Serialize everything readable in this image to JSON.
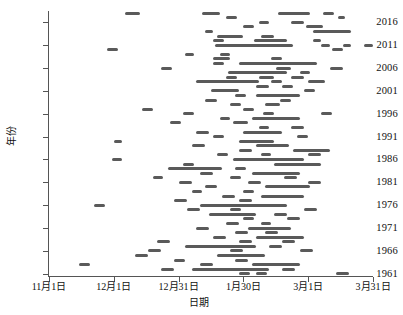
{
  "chart_data": {
    "type": "scatter",
    "title": "",
    "xlabel": "日期",
    "ylabel": "年份",
    "grid": false,
    "legend": null,
    "x_axis": {
      "unit": "day-of-season (day 0 = 11月1日)",
      "min": 0,
      "max": 150,
      "tick_values": [
        0,
        30,
        60,
        90,
        120,
        150
      ],
      "tick_labels": [
        "11月1日",
        "12月1日",
        "12月31日",
        "1月30日",
        "3月1日",
        "3月31日"
      ]
    },
    "y_axis": {
      "min": 1960.5,
      "max": 2018.5,
      "tick_values": [
        1961,
        1966,
        1971,
        1976,
        1981,
        1986,
        1991,
        1996,
        2001,
        2006,
        2011,
        2016
      ],
      "tick_labels": [
        "1961",
        "1966",
        "1971",
        "1976",
        "1981",
        "1986",
        "1991",
        "1996",
        "2001",
        "2006",
        "2011",
        "2016"
      ]
    },
    "marker": {
      "shape": "horizontal-bar",
      "color": "#5a5a5a",
      "height_px": 3,
      "description": "each bar is a continuous run of daily points = one snow-cover / event interval"
    },
    "series_name": "逐年事件日期区间",
    "segments": [
      {
        "year": 2018,
        "start": 35,
        "end": 42
      },
      {
        "year": 2018,
        "start": 71,
        "end": 79
      },
      {
        "year": 2018,
        "start": 106,
        "end": 121
      },
      {
        "year": 2018,
        "start": 127,
        "end": 132
      },
      {
        "year": 2017,
        "start": 82,
        "end": 87
      },
      {
        "year": 2017,
        "start": 134,
        "end": 137
      },
      {
        "year": 2016,
        "start": 97,
        "end": 102
      },
      {
        "year": 2016,
        "start": 112,
        "end": 118
      },
      {
        "year": 2015,
        "start": 90,
        "end": 95
      },
      {
        "year": 2015,
        "start": 119,
        "end": 127
      },
      {
        "year": 2014,
        "start": 72,
        "end": 76
      },
      {
        "year": 2014,
        "start": 122,
        "end": 140
      },
      {
        "year": 2013,
        "start": 78,
        "end": 90
      },
      {
        "year": 2013,
        "start": 98,
        "end": 104
      },
      {
        "year": 2012,
        "start": 76,
        "end": 81
      },
      {
        "year": 2012,
        "start": 95,
        "end": 110
      },
      {
        "year": 2012,
        "start": 122,
        "end": 126
      },
      {
        "year": 2011,
        "start": 77,
        "end": 113
      },
      {
        "year": 2011,
        "start": 126,
        "end": 130
      },
      {
        "year": 2011,
        "start": 136,
        "end": 140
      },
      {
        "year": 2011,
        "start": 146,
        "end": 150
      },
      {
        "year": 2010,
        "start": 27,
        "end": 32
      },
      {
        "year": 2010,
        "start": 131,
        "end": 136
      },
      {
        "year": 2009,
        "start": 63,
        "end": 67
      },
      {
        "year": 2009,
        "start": 79,
        "end": 84
      },
      {
        "year": 2008,
        "start": 103,
        "end": 108
      },
      {
        "year": 2008,
        "start": 76,
        "end": 84
      },
      {
        "year": 2007,
        "start": 88,
        "end": 124
      },
      {
        "year": 2007,
        "start": 76,
        "end": 81
      },
      {
        "year": 2006,
        "start": 52,
        "end": 57
      },
      {
        "year": 2006,
        "start": 105,
        "end": 112
      },
      {
        "year": 2006,
        "start": 130,
        "end": 136
      },
      {
        "year": 2005,
        "start": 83,
        "end": 110
      },
      {
        "year": 2005,
        "start": 116,
        "end": 121
      },
      {
        "year": 2004,
        "start": 82,
        "end": 87
      },
      {
        "year": 2004,
        "start": 97,
        "end": 104
      },
      {
        "year": 2004,
        "start": 112,
        "end": 118
      },
      {
        "year": 2003,
        "start": 68,
        "end": 97
      },
      {
        "year": 2003,
        "start": 103,
        "end": 108
      },
      {
        "year": 2003,
        "start": 120,
        "end": 128
      },
      {
        "year": 2002,
        "start": 96,
        "end": 102
      },
      {
        "year": 2002,
        "start": 108,
        "end": 113
      },
      {
        "year": 2001,
        "start": 75,
        "end": 88
      },
      {
        "year": 2001,
        "start": 118,
        "end": 123
      },
      {
        "year": 2000,
        "start": 86,
        "end": 91
      },
      {
        "year": 2000,
        "start": 96,
        "end": 116
      },
      {
        "year": 1999,
        "start": 72,
        "end": 78
      },
      {
        "year": 1999,
        "start": 107,
        "end": 112
      },
      {
        "year": 1998,
        "start": 84,
        "end": 89
      },
      {
        "year": 1998,
        "start": 100,
        "end": 107
      },
      {
        "year": 1997,
        "start": 43,
        "end": 48
      },
      {
        "year": 1997,
        "start": 90,
        "end": 95
      },
      {
        "year": 1996,
        "start": 62,
        "end": 67
      },
      {
        "year": 1996,
        "start": 99,
        "end": 104
      },
      {
        "year": 1996,
        "start": 126,
        "end": 131
      },
      {
        "year": 1995,
        "start": 79,
        "end": 84
      },
      {
        "year": 1995,
        "start": 94,
        "end": 116
      },
      {
        "year": 1994,
        "start": 56,
        "end": 61
      },
      {
        "year": 1994,
        "start": 85,
        "end": 92
      },
      {
        "year": 1993,
        "start": 97,
        "end": 102
      },
      {
        "year": 1993,
        "start": 112,
        "end": 118
      },
      {
        "year": 1992,
        "start": 68,
        "end": 74
      },
      {
        "year": 1992,
        "start": 90,
        "end": 108
      },
      {
        "year": 1991,
        "start": 76,
        "end": 81
      },
      {
        "year": 1991,
        "start": 115,
        "end": 120
      },
      {
        "year": 1990,
        "start": 30,
        "end": 34
      },
      {
        "year": 1990,
        "start": 88,
        "end": 104
      },
      {
        "year": 1989,
        "start": 66,
        "end": 72
      },
      {
        "year": 1989,
        "start": 96,
        "end": 111
      },
      {
        "year": 1988,
        "start": 88,
        "end": 94
      },
      {
        "year": 1988,
        "start": 113,
        "end": 130
      },
      {
        "year": 1987,
        "start": 78,
        "end": 83
      },
      {
        "year": 1987,
        "start": 98,
        "end": 103
      },
      {
        "year": 1987,
        "start": 120,
        "end": 126
      },
      {
        "year": 1986,
        "start": 29,
        "end": 34
      },
      {
        "year": 1986,
        "start": 85,
        "end": 118
      },
      {
        "year": 1985,
        "start": 62,
        "end": 67
      },
      {
        "year": 1985,
        "start": 104,
        "end": 126
      },
      {
        "year": 1984,
        "start": 55,
        "end": 80
      },
      {
        "year": 1984,
        "start": 86,
        "end": 91
      },
      {
        "year": 1983,
        "start": 70,
        "end": 76
      },
      {
        "year": 1983,
        "start": 94,
        "end": 116
      },
      {
        "year": 1982,
        "start": 48,
        "end": 53
      },
      {
        "year": 1982,
        "start": 84,
        "end": 89
      },
      {
        "year": 1982,
        "start": 109,
        "end": 115
      },
      {
        "year": 1981,
        "start": 60,
        "end": 66
      },
      {
        "year": 1981,
        "start": 92,
        "end": 98
      },
      {
        "year": 1981,
        "start": 120,
        "end": 126
      },
      {
        "year": 1980,
        "start": 72,
        "end": 78
      },
      {
        "year": 1980,
        "start": 100,
        "end": 121
      },
      {
        "year": 1979,
        "start": 66,
        "end": 71
      },
      {
        "year": 1979,
        "start": 90,
        "end": 95
      },
      {
        "year": 1978,
        "start": 80,
        "end": 86
      },
      {
        "year": 1978,
        "start": 98,
        "end": 118
      },
      {
        "year": 1977,
        "start": 58,
        "end": 64
      },
      {
        "year": 1977,
        "start": 88,
        "end": 94
      },
      {
        "year": 1976,
        "start": 21,
        "end": 26
      },
      {
        "year": 1976,
        "start": 70,
        "end": 110
      },
      {
        "year": 1975,
        "start": 64,
        "end": 70
      },
      {
        "year": 1975,
        "start": 84,
        "end": 89
      },
      {
        "year": 1975,
        "start": 118,
        "end": 124
      },
      {
        "year": 1974,
        "start": 74,
        "end": 96
      },
      {
        "year": 1974,
        "start": 104,
        "end": 110
      },
      {
        "year": 1973,
        "start": 90,
        "end": 95
      },
      {
        "year": 1973,
        "start": 110,
        "end": 116
      },
      {
        "year": 1972,
        "start": 82,
        "end": 88
      },
      {
        "year": 1972,
        "start": 98,
        "end": 103
      },
      {
        "year": 1971,
        "start": 68,
        "end": 74
      },
      {
        "year": 1971,
        "start": 92,
        "end": 112
      },
      {
        "year": 1970,
        "start": 86,
        "end": 92
      },
      {
        "year": 1970,
        "start": 100,
        "end": 106
      },
      {
        "year": 1969,
        "start": 76,
        "end": 82
      },
      {
        "year": 1969,
        "start": 96,
        "end": 118
      },
      {
        "year": 1968,
        "start": 50,
        "end": 56
      },
      {
        "year": 1968,
        "start": 88,
        "end": 94
      },
      {
        "year": 1968,
        "start": 108,
        "end": 114
      },
      {
        "year": 1967,
        "start": 63,
        "end": 96
      },
      {
        "year": 1967,
        "start": 102,
        "end": 108
      },
      {
        "year": 1966,
        "start": 46,
        "end": 52
      },
      {
        "year": 1966,
        "start": 84,
        "end": 90
      },
      {
        "year": 1966,
        "start": 116,
        "end": 122
      },
      {
        "year": 1965,
        "start": 40,
        "end": 46
      },
      {
        "year": 1965,
        "start": 78,
        "end": 100
      },
      {
        "year": 1964,
        "start": 58,
        "end": 63
      },
      {
        "year": 1964,
        "start": 86,
        "end": 92
      },
      {
        "year": 1963,
        "start": 14,
        "end": 19
      },
      {
        "year": 1963,
        "start": 70,
        "end": 76
      },
      {
        "year": 1963,
        "start": 94,
        "end": 116
      },
      {
        "year": 1962,
        "start": 52,
        "end": 58
      },
      {
        "year": 1962,
        "start": 66,
        "end": 102
      },
      {
        "year": 1962,
        "start": 108,
        "end": 114
      },
      {
        "year": 1961,
        "start": 88,
        "end": 93
      },
      {
        "year": 1961,
        "start": 96,
        "end": 101
      },
      {
        "year": 1961,
        "start": 133,
        "end": 139
      }
    ]
  }
}
